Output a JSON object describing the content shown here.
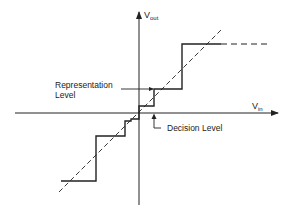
{
  "diagram": {
    "type": "quantizer-transfer-characteristic",
    "axes": {
      "y_label_main": "V",
      "y_label_sub": "out",
      "x_label_main": "V",
      "x_label_sub": "in"
    },
    "annotations": {
      "representation_level_line1": "Representation",
      "representation_level_line2": "Level",
      "decision_level": "Decision Level"
    },
    "colors": {
      "line": "#222222",
      "background": "#ffffff"
    }
  }
}
